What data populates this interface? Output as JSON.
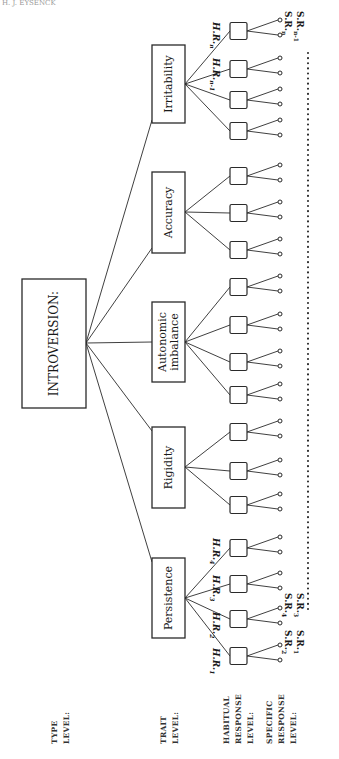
{
  "header": {
    "running_head": "H. J. EYSENCK"
  },
  "level_labels": {
    "type": [
      "TYPE",
      "LEVEL:"
    ],
    "trait": [
      "TRAIT",
      "LEVEL:"
    ],
    "habitual": [
      "HABITUAL",
      "RESPONSE",
      "LEVEL:"
    ],
    "specific": [
      "SPECIFIC",
      "RESPONSE",
      "LEVEL:"
    ]
  },
  "type_node": {
    "label": "INTROVERSION:"
  },
  "traits": [
    {
      "label": "Persistence",
      "lines": [
        "Persistence"
      ]
    },
    {
      "label": "Rigidity",
      "lines": [
        "Rigidity"
      ]
    },
    {
      "label": "Autonomic imbalance",
      "lines": [
        "Autonomic",
        "imbalance"
      ]
    },
    {
      "label": "Accuracy",
      "lines": [
        "Accuracy"
      ]
    },
    {
      "label": "Irritability",
      "lines": [
        "Irritability"
      ]
    }
  ],
  "habitual_labels": [
    {
      "text": "H.R.",
      "sub": "1"
    },
    {
      "text": "H.R.",
      "sub": "2"
    },
    {
      "text": "H.R.",
      "sub": "3"
    },
    {
      "text": "H.R.",
      "sub": "4"
    },
    {
      "text": "H.R.",
      "sub": "n-1"
    },
    {
      "text": "H.R.",
      "sub": "n"
    }
  ],
  "specific_labels": [
    {
      "text": "S.R.",
      "sub": "1"
    },
    {
      "text": "S.R.",
      "sub": "2"
    },
    {
      "text": "S.R.",
      "sub": "3"
    },
    {
      "text": "S.R.",
      "sub": "4"
    },
    {
      "text": "S.R.",
      "sub": "n-1"
    },
    {
      "text": "S.R.",
      "sub": "n"
    }
  ],
  "colors": {
    "ink": "#2a2a2a",
    "background": "#ffffff"
  }
}
